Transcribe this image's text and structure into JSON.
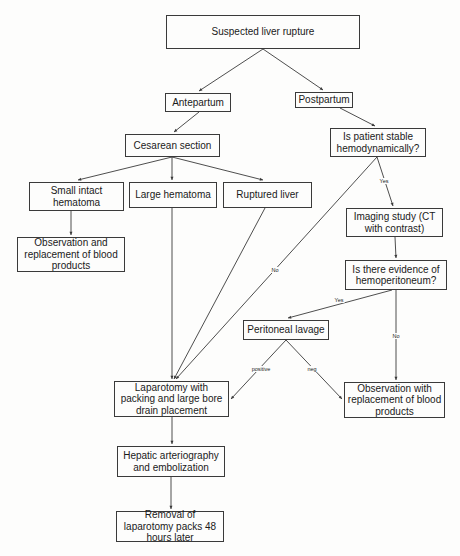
{
  "diagram": {
    "type": "flowchart",
    "nodes": {
      "suspected": "Suspected liver rupture",
      "antepartum": "Antepartum",
      "postpartum": "Postpartum",
      "cesarean": "Cesarean section",
      "stable": "Is patient stable hemodynamically?",
      "small_hematoma": "Small intact hematoma",
      "large_hematoma": "Large hematoma",
      "ruptured": "Ruptured liver",
      "imaging": "Imaging study (CT with contrast)",
      "observation_left": "Observation and replacement of blood products",
      "hemoperitoneum": "Is there evidence of hemoperitoneum?",
      "lavage": "Peritoneal lavage",
      "laparotomy": "Laparotomy with packing and large bore drain placement",
      "observation_right": "Observation with replacement of blood products",
      "hepatic": "Hepatic arteriography and embolization",
      "removal": "Removal of laparotomy packs 48 hours later"
    },
    "edge_labels": {
      "stable_yes": "Yes",
      "stable_no": "No",
      "hemo_yes": "Yes",
      "hemo_no": "No",
      "lavage_positive": "positive",
      "lavage_neg": "neg"
    },
    "edges": [
      {
        "from": "suspected",
        "to": "antepartum"
      },
      {
        "from": "suspected",
        "to": "postpartum"
      },
      {
        "from": "antepartum",
        "to": "cesarean"
      },
      {
        "from": "postpartum",
        "to": "stable"
      },
      {
        "from": "cesarean",
        "to": "small_hematoma"
      },
      {
        "from": "cesarean",
        "to": "large_hematoma"
      },
      {
        "from": "cesarean",
        "to": "ruptured"
      },
      {
        "from": "small_hematoma",
        "to": "observation_left"
      },
      {
        "from": "stable",
        "to": "imaging",
        "label": "Yes"
      },
      {
        "from": "stable",
        "to": "laparotomy",
        "label": "No"
      },
      {
        "from": "large_hematoma",
        "to": "laparotomy"
      },
      {
        "from": "ruptured",
        "to": "laparotomy"
      },
      {
        "from": "imaging",
        "to": "hemoperitoneum"
      },
      {
        "from": "hemoperitoneum",
        "to": "lavage",
        "label": "Yes"
      },
      {
        "from": "hemoperitoneum",
        "to": "observation_right",
        "label": "No"
      },
      {
        "from": "lavage",
        "to": "laparotomy",
        "label": "positive"
      },
      {
        "from": "lavage",
        "to": "observation_right",
        "label": "neg"
      },
      {
        "from": "laparotomy",
        "to": "hepatic"
      },
      {
        "from": "hepatic",
        "to": "removal"
      }
    ],
    "colors": {
      "line": "#3a3a3a",
      "background": "#fdfdfc",
      "text": "#1a1a1a"
    }
  }
}
